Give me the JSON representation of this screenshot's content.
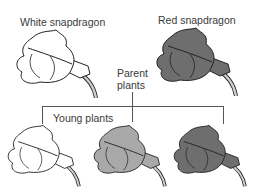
{
  "labels": {
    "white_parent": "White snapdragon",
    "red_parent": "Red snapdragon",
    "parent_line1": "Parent",
    "parent_line2": "plants",
    "offspring": "Young plants"
  },
  "flowers": [
    {
      "name": "white-parent",
      "fill": "#ffffff"
    },
    {
      "name": "red-parent",
      "fill": "#6e6e6e"
    },
    {
      "name": "offspring-white",
      "fill": "#ffffff"
    },
    {
      "name": "offspring-pink",
      "fill": "#a9a9a9"
    },
    {
      "name": "offspring-red",
      "fill": "#6e6e6e"
    }
  ],
  "colors": {
    "outline": "#222222",
    "stem": "#cfcfcf",
    "connector": "#555555"
  }
}
